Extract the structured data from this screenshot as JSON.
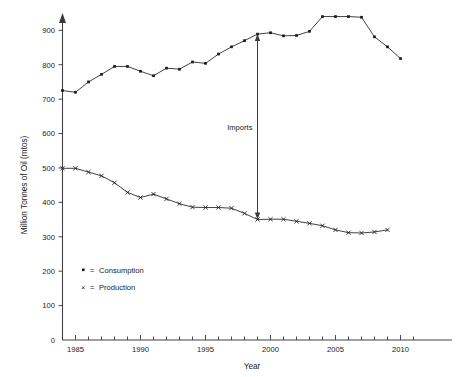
{
  "chart_data": {
    "type": "line",
    "title": "",
    "xlabel": "Year",
    "ylabel": "Million Tonnes of Oil (mtos)",
    "xlim": [
      1984,
      2012
    ],
    "ylim": [
      0,
      930
    ],
    "grid": false,
    "legend_position": "bottom-left",
    "x": [
      1984,
      1985,
      1986,
      1987,
      1988,
      1989,
      1990,
      1991,
      1992,
      1993,
      1994,
      1995,
      1996,
      1997,
      1998,
      1999,
      2000,
      2001,
      2002,
      2003,
      2004,
      2005,
      2006,
      2007,
      2008,
      2009,
      2010
    ],
    "series": [
      {
        "name": "Consumption",
        "marker": "dot",
        "values": [
          725,
          720,
          750,
          772,
          795,
          795,
          781,
          768,
          790,
          787,
          808,
          804,
          831,
          852,
          870,
          889,
          893,
          884,
          885,
          897,
          940,
          940,
          940,
          938,
          881,
          852,
          818
        ]
      },
      {
        "name": "Production",
        "marker": "x",
        "values": [
          499,
          499,
          488,
          477,
          457,
          429,
          414,
          424,
          410,
          396,
          386,
          385,
          385,
          383,
          368,
          350,
          351,
          351,
          345,
          339,
          332,
          320,
          312,
          311,
          314,
          320,
          null
        ]
      }
    ],
    "y_ticks": [
      0,
      100,
      200,
      300,
      400,
      500,
      600,
      700,
      800,
      900
    ],
    "y_tick_labels": [
      "0",
      "100",
      "200",
      "300",
      "400",
      "500",
      "600",
      "700",
      "800",
      "900"
    ],
    "x_major_ticks": [
      1985,
      1990,
      1995,
      2000,
      2005,
      2010
    ],
    "x_major_tick_labels": [
      "1985",
      "1990",
      "1995",
      "2000",
      "2005",
      "2010"
    ],
    "x_minor_tick_start": 1984,
    "x_minor_tick_end": 2011,
    "annotations": [
      {
        "label": "Imports",
        "type": "double-arrow",
        "x": 1999,
        "y_from": 350,
        "y_to": 889
      }
    ],
    "legend": [
      {
        "symbol": "▪",
        "separator": "=",
        "label": "Consumption"
      },
      {
        "symbol": "×",
        "separator": "=",
        "label": "Production"
      }
    ],
    "colors": {
      "line": "#2b2b2b",
      "axis": "#444444",
      "text": "#1a1a1a",
      "background": "#ffffff"
    }
  }
}
